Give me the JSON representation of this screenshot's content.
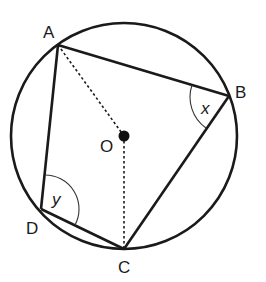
{
  "diagram": {
    "points": {
      "A": {
        "label": "A",
        "x": 58,
        "y": 45
      },
      "B": {
        "label": "B",
        "x": 229,
        "y": 96
      },
      "C": {
        "label": "C",
        "x": 124,
        "y": 249
      },
      "D": {
        "label": "D",
        "x": 41,
        "y": 209
      },
      "O": {
        "label": "O",
        "x": 124,
        "y": 136
      }
    },
    "angles": {
      "x": {
        "label": "x",
        "vertex": "B"
      },
      "y": {
        "label": "y",
        "vertex": "D"
      }
    },
    "segments": {
      "solid": [
        "AB",
        "BC",
        "CD",
        "DA"
      ],
      "dashed": [
        "OA",
        "OC"
      ]
    },
    "circle": {
      "cx": 124,
      "cy": 136,
      "r": 113
    },
    "colors": {
      "stroke": "#1a1a1a",
      "background": "#ffffff"
    }
  }
}
